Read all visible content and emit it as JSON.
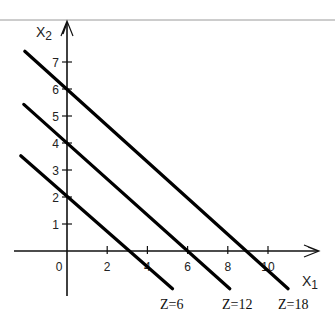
{
  "chart_data": {
    "type": "line",
    "title": "",
    "xlabel": "x1",
    "ylabel": "x2",
    "xlabel_main": "X",
    "xlabel_sub": "1",
    "ylabel_main": "X",
    "ylabel_sub": "2",
    "x_ticks": [
      0,
      2,
      4,
      6,
      8,
      10
    ],
    "y_ticks": [
      1,
      2,
      3,
      4,
      5,
      6,
      7
    ],
    "xlim": [
      -2.6,
      12.6
    ],
    "ylim": [
      -1.7,
      8.5
    ],
    "grid": false,
    "legend": "inline labels below lines",
    "objective": "Z = 2x1 + 3x2",
    "series": [
      {
        "name": "Z=6",
        "z": 6,
        "x_intercept": 3,
        "y_intercept": 2,
        "points": [
          [
            -2.3,
            3.53
          ],
          [
            5.25,
            -1.4
          ]
        ]
      },
      {
        "name": "Z=12",
        "z": 12,
        "x_intercept": 6,
        "y_intercept": 4,
        "points": [
          [
            -2.15,
            5.43
          ],
          [
            8.1,
            -1.4
          ]
        ]
      },
      {
        "name": "Z=18",
        "z": 18,
        "x_intercept": 9,
        "y_intercept": 6,
        "points": [
          [
            -2.1,
            7.4
          ],
          [
            11.0,
            -1.4
          ]
        ]
      }
    ]
  }
}
